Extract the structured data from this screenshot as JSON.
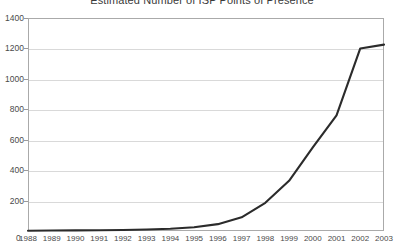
{
  "chart_data": {
    "type": "line",
    "title": "Estimated Number of ISP Points of Presence",
    "xlabel": "",
    "ylabel": "",
    "categories": [
      "1988",
      "1989",
      "1990",
      "1991",
      "1992",
      "1993",
      "1994",
      "1995",
      "1996",
      "1997",
      "1998",
      "1999",
      "2000",
      "2001",
      "2002",
      "2003"
    ],
    "values": [
      2,
      3,
      4,
      5,
      7,
      10,
      15,
      25,
      45,
      90,
      185,
      330,
      550,
      760,
      1200,
      1225
    ],
    "series": [
      {
        "name": "ISP Points of Presence",
        "values": [
          2,
          3,
          4,
          5,
          7,
          10,
          15,
          25,
          45,
          90,
          185,
          330,
          550,
          760,
          1200,
          1225
        ],
        "color": "#2b2b2b"
      }
    ],
    "ylim": [
      0,
      1400
    ],
    "yticks": [
      0,
      200,
      400,
      600,
      800,
      1000,
      1200,
      1400
    ],
    "ytick_labels": [
      "0",
      "200",
      "400",
      "600",
      "800",
      "1000",
      "1200",
      "1400"
    ],
    "xlim": [
      "1988",
      "2003"
    ],
    "grid": "horizontal",
    "legend": "none",
    "origin_label": "0",
    "colors": {
      "line": "#2b2b2b",
      "grid": "#d9d9d9",
      "frame": "#aaaaaa",
      "text": "#4a4a4a",
      "title": "#3a3a3a",
      "background": "#ffffff"
    }
  }
}
